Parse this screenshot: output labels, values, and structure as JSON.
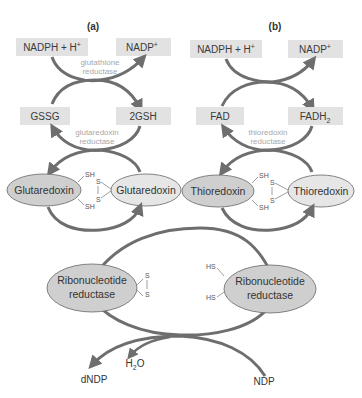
{
  "colors": {
    "arrow": "#6e6e6e",
    "box_fill": "#e2e2e2",
    "ellipse_fill": "#cfcfcf",
    "ellipse_stroke": "#666666",
    "enzyme_text": "#a8a8a8"
  },
  "panel_a": {
    "label": "(a)",
    "top_left": "NADPH + H",
    "top_left_sup": "+",
    "top_right": "NADP",
    "top_right_sup": "+",
    "enzyme1_line1": "glutathione",
    "enzyme1_line2": "reductase",
    "mid_left": "GSSG",
    "mid_right": "2GSH",
    "enzyme2_line1": "glutaredoxin",
    "enzyme2_line2": "reductase",
    "protein_left": "Glutaredoxin",
    "protein_right": "Glutaredoxin",
    "sh_top": "SH",
    "sh_bottom": "SH",
    "s_top": "S",
    "s_bottom": "S"
  },
  "panel_b": {
    "label": "(b)",
    "top_left": "NADPH + H",
    "top_left_sup": "+",
    "top_right": "NADP",
    "top_right_sup": "+",
    "mid_left": "FAD",
    "mid_right": "FADH",
    "mid_right_sub": "2",
    "enzyme2_line1": "thioredoxin",
    "enzyme2_line2": "reductase",
    "protein_left": "Thioredoxin",
    "protein_right": "Thioredoxin",
    "sh_top": "SH",
    "sh_bottom": "SH",
    "s_top": "S",
    "s_bottom": "S"
  },
  "bottom": {
    "rnr_left_line1": "Ribonucleotide",
    "rnr_left_line2": "reductase",
    "rnr_right_line1": "Ribonucleotide",
    "rnr_right_line2": "reductase",
    "s_top": "S",
    "s_bottom": "S",
    "hs_top": "HS",
    "hs_bottom": "HS",
    "product": "dNDP",
    "water": "H",
    "water_sub": "2",
    "water_end": "O",
    "substrate": "NDP"
  }
}
